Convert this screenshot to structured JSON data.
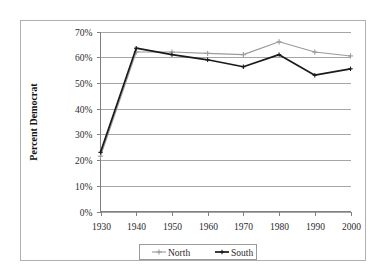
{
  "chart_data": {
    "type": "line",
    "title": "",
    "xlabel": "",
    "ylabel": "Percent Democrat",
    "x": [
      1930,
      1940,
      1950,
      1960,
      1970,
      1980,
      1990,
      2000
    ],
    "categories": [
      "1930",
      "1940",
      "1950",
      "1960",
      "1970",
      "1980",
      "1990",
      "2000"
    ],
    "series": [
      {
        "name": "North",
        "color": "#9a9a9a",
        "marker": "plus",
        "values": [
          21.5,
          62.0,
          62.0,
          61.5,
          61.0,
          66.0,
          62.0,
          60.5
        ]
      },
      {
        "name": "South",
        "color": "#1a1a1a",
        "marker": "plus",
        "values": [
          23.0,
          63.5,
          61.0,
          59.0,
          56.3,
          61.0,
          53.0,
          55.5
        ]
      }
    ],
    "ylim": [
      0,
      70
    ],
    "xlim": [
      1930,
      2000
    ],
    "y_ticks": [
      0,
      10,
      20,
      30,
      40,
      50,
      60,
      70
    ],
    "y_tick_labels": [
      "0%",
      "10%",
      "20%",
      "30%",
      "40%",
      "50%",
      "60%",
      "70%"
    ],
    "x_tick_labels": [
      "1930",
      "1940",
      "1950",
      "1960",
      "1970",
      "1980",
      "1990",
      "2000"
    ],
    "grid": "horizontal",
    "legend_position": "bottom",
    "legend_entries": [
      "North",
      "South"
    ]
  },
  "colors": {
    "north": "#9a9a9a",
    "south": "#1a1a1a",
    "gridline": "#a6a6a6",
    "axis": "#808080",
    "border": "#b0b0b0",
    "background": "#ffffff"
  }
}
